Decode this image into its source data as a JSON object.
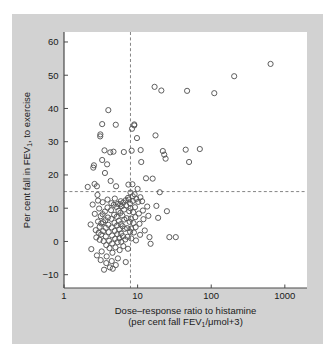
{
  "figure": {
    "background_color": "#ffffff",
    "panel_color": "#d2d2d2",
    "plot_background_color": "#ffffff"
  },
  "chart_data": {
    "type": "scatter",
    "title": "",
    "xlabel": "Dose–response ratio to histamine",
    "xlabel_line2_prefix": "(per cent fall FEV",
    "xlabel_line2_sub": "1",
    "xlabel_line2_suffix": "/μmol+3)",
    "ylabel_prefix": "Per cent fall in FEV",
    "ylabel_sub": "1",
    "ylabel_suffix": ", to exercise",
    "xscale": "log",
    "yscale": "linear",
    "xlim": [
      1,
      2000
    ],
    "ylim": [
      -14,
      63
    ],
    "xticks": [
      1,
      10,
      100,
      1000
    ],
    "xtick_labels": [
      "1",
      "10",
      "100",
      "1000"
    ],
    "yticks": [
      -10,
      0,
      10,
      20,
      30,
      40,
      50,
      60
    ],
    "ytick_labels": [
      "−10",
      "0",
      "10",
      "20",
      "30",
      "40",
      "50",
      "60"
    ],
    "grid": false,
    "legend": "none",
    "marker": "open-circle",
    "marker_color": "#555555",
    "marker_radius": 2.6,
    "reference_lines": [
      {
        "name": "exercise-threshold",
        "orientation": "horizontal",
        "value": 15,
        "style": "dashed",
        "color": "#777777"
      },
      {
        "name": "histamine-threshold",
        "orientation": "vertical",
        "value": 8,
        "style": "dashed",
        "color": "#777777"
      }
    ],
    "n_points": 178,
    "points": [
      [
        2.1,
        16.4
      ],
      [
        2.3,
        5.1
      ],
      [
        2.35,
        -2.3
      ],
      [
        2.5,
        22.2
      ],
      [
        2.55,
        22.9
      ],
      [
        2.6,
        17.3
      ],
      [
        2.62,
        8.3
      ],
      [
        2.7,
        3.4
      ],
      [
        2.75,
        1.2
      ],
      [
        2.8,
        16.6
      ],
      [
        2.85,
        14.0
      ],
      [
        2.9,
        6.0
      ],
      [
        2.95,
        2.6
      ],
      [
        3.0,
        9.9
      ],
      [
        3.05,
        4.4
      ],
      [
        3.05,
        0.5
      ],
      [
        3.1,
        31.6
      ],
      [
        3.12,
        32.2
      ],
      [
        3.15,
        7.6
      ],
      [
        3.2,
        5.4
      ],
      [
        3.2,
        2.1
      ],
      [
        3.25,
        -3.0
      ],
      [
        3.3,
        35.3
      ],
      [
        3.3,
        24.5
      ],
      [
        3.35,
        8.2
      ],
      [
        3.4,
        5.8
      ],
      [
        3.4,
        3.1
      ],
      [
        3.45,
        0.1
      ],
      [
        3.5,
        -8.5
      ],
      [
        3.55,
        27.4
      ],
      [
        3.6,
        20.6
      ],
      [
        3.6,
        9.0
      ],
      [
        3.65,
        6.4
      ],
      [
        3.7,
        4.1
      ],
      [
        3.7,
        1.5
      ],
      [
        3.75,
        -1.1
      ],
      [
        3.8,
        -4.5
      ],
      [
        3.85,
        23.2
      ],
      [
        3.9,
        10.2
      ],
      [
        3.95,
        7.2
      ],
      [
        4.0,
        39.5
      ],
      [
        4.0,
        5.0
      ],
      [
        4.05,
        2.8
      ],
      [
        4.1,
        0.2
      ],
      [
        4.15,
        -2.0
      ],
      [
        4.2,
        -7.8
      ],
      [
        4.25,
        26.8
      ],
      [
        4.3,
        18.2
      ],
      [
        4.35,
        9.4
      ],
      [
        4.4,
        6.8
      ],
      [
        4.45,
        4.2
      ],
      [
        4.5,
        1.8
      ],
      [
        4.5,
        -0.6
      ],
      [
        4.55,
        -3.4
      ],
      [
        4.6,
        -8.2
      ],
      [
        4.7,
        27.0
      ],
      [
        4.75,
        11.0
      ],
      [
        4.8,
        8.0
      ],
      [
        4.85,
        5.6
      ],
      [
        4.9,
        3.2
      ],
      [
        4.95,
        0.8
      ],
      [
        5.0,
        -1.8
      ],
      [
        5.05,
        35.1
      ],
      [
        5.1,
        16.6
      ],
      [
        5.15,
        10.4
      ],
      [
        5.2,
        7.4
      ],
      [
        5.25,
        4.8
      ],
      [
        5.3,
        2.2
      ],
      [
        5.35,
        -0.2
      ],
      [
        5.4,
        -5.1
      ],
      [
        5.5,
        9.2
      ],
      [
        5.55,
        6.2
      ],
      [
        5.6,
        3.6
      ],
      [
        5.65,
        1.0
      ],
      [
        5.7,
        -2.6
      ],
      [
        5.8,
        11.2
      ],
      [
        5.85,
        8.6
      ],
      [
        5.9,
        5.2
      ],
      [
        5.95,
        2.4
      ],
      [
        6.0,
        -0.1
      ],
      [
        6.1,
        10.6
      ],
      [
        6.2,
        7.8
      ],
      [
        6.25,
        4.6
      ],
      [
        6.3,
        1.6
      ],
      [
        6.4,
        -1.4
      ],
      [
        6.5,
        26.9
      ],
      [
        6.55,
        9.6
      ],
      [
        6.6,
        6.6
      ],
      [
        6.7,
        3.8
      ],
      [
        6.8,
        0.6
      ],
      [
        6.9,
        -6.2
      ],
      [
        7.0,
        10.8
      ],
      [
        7.1,
        7.0
      ],
      [
        7.2,
        4.0
      ],
      [
        7.3,
        1.4
      ],
      [
        7.4,
        -2.2
      ],
      [
        7.5,
        17.1
      ],
      [
        7.6,
        12.6
      ],
      [
        7.7,
        9.1
      ],
      [
        7.8,
        5.9
      ],
      [
        7.9,
        2.9
      ],
      [
        8.0,
        14.7
      ],
      [
        8.0,
        10.0
      ],
      [
        8.1,
        6.9
      ],
      [
        8.15,
        3.9
      ],
      [
        8.2,
        0.9
      ],
      [
        8.3,
        27.3
      ],
      [
        8.4,
        33.9
      ],
      [
        8.5,
        17.2
      ],
      [
        8.6,
        12.2
      ],
      [
        8.7,
        8.8
      ],
      [
        8.8,
        5.5
      ],
      [
        8.9,
        2.7
      ],
      [
        9.0,
        34.9
      ],
      [
        9.0,
        35.2
      ],
      [
        9.1,
        14.2
      ],
      [
        9.2,
        10.3
      ],
      [
        9.3,
        7.3
      ],
      [
        9.4,
        4.3
      ],
      [
        9.5,
        0.3
      ],
      [
        9.8,
        31.1
      ],
      [
        10.0,
        15.8
      ],
      [
        10.2,
        11.9
      ],
      [
        10.4,
        8.4
      ],
      [
        10.6,
        5.3
      ],
      [
        10.8,
        2.0
      ],
      [
        11.0,
        27.5
      ],
      [
        11.2,
        23.9
      ],
      [
        11.5,
        12.1
      ],
      [
        11.8,
        9.3
      ],
      [
        12.0,
        6.7
      ],
      [
        12.5,
        3.3
      ],
      [
        13.0,
        19.0
      ],
      [
        13.5,
        10.5
      ],
      [
        14.0,
        7.7
      ],
      [
        14.5,
        1.3
      ],
      [
        15.0,
        -0.7
      ],
      [
        16.0,
        18.9
      ],
      [
        17.0,
        46.5
      ],
      [
        17.5,
        31.9
      ],
      [
        18.0,
        10.7
      ],
      [
        19.0,
        7.1
      ],
      [
        20.0,
        14.8
      ],
      [
        21.0,
        45.4
      ],
      [
        22.0,
        27.2
      ],
      [
        23.0,
        26.1
      ],
      [
        24.0,
        24.9
      ],
      [
        25.0,
        9.1
      ],
      [
        27.0,
        1.3
      ],
      [
        33.0,
        1.3
      ],
      [
        45.0,
        27.6
      ],
      [
        47.0,
        45.3
      ],
      [
        50.0,
        23.9
      ],
      [
        70.0,
        27.8
      ],
      [
        110.0,
        44.6
      ],
      [
        205.0,
        49.7
      ],
      [
        640.0,
        53.4
      ],
      [
        2.45,
        11.1
      ],
      [
        2.9,
        12.3
      ],
      [
        3.35,
        11.8
      ],
      [
        3.9,
        12.6
      ],
      [
        4.4,
        11.5
      ],
      [
        4.9,
        12.9
      ],
      [
        5.4,
        11.3
      ],
      [
        5.9,
        12.1
      ],
      [
        6.4,
        11.7
      ],
      [
        6.9,
        12.4
      ],
      [
        3.15,
        -5.6
      ],
      [
        3.75,
        -6.5
      ],
      [
        4.45,
        -5.9
      ],
      [
        5.05,
        -7.1
      ],
      [
        2.8,
        -4.2
      ],
      [
        7.4,
        13.1
      ],
      [
        7.9,
        11.4
      ],
      [
        8.6,
        13.6
      ],
      [
        9.6,
        12.8
      ],
      [
        10.9,
        13.3
      ]
    ]
  }
}
